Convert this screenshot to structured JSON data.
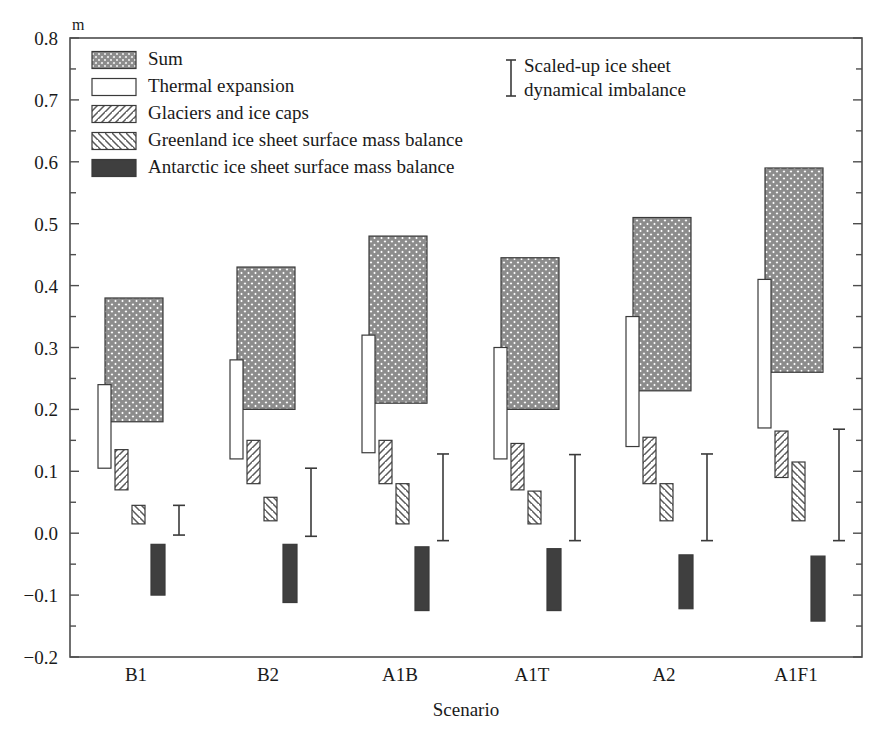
{
  "figure": {
    "y_axis_unit": "m",
    "x_axis_title": "Scenario",
    "y_ticks": [
      "0.8",
      "0.7",
      "0.6",
      "0.5",
      "0.4",
      "0.3",
      "0.2",
      "0.1",
      "0.0",
      "-0.1",
      "-0.2"
    ],
    "frame_color": "#4d4d4d",
    "sum_fill_color": "#9a9a9a",
    "antarctic_fill_color": "#3f3f3f",
    "outline_color": "#3a3a3a"
  },
  "legend": {
    "items": [
      {
        "label": "Sum",
        "pattern": "crosshatch"
      },
      {
        "label": "Thermal expansion",
        "pattern": "empty"
      },
      {
        "label": "Glaciers and ice caps",
        "pattern": "diag-forward"
      },
      {
        "label": "Greenland ice sheet surface mass balance",
        "pattern": "diag-back"
      },
      {
        "label": "Antarctic ice sheet surface mass balance",
        "pattern": "solid"
      }
    ]
  },
  "annotation": {
    "line1": "Scaled-up ice sheet",
    "line2": "dynamical imbalance"
  },
  "chart_data": {
    "type": "bar",
    "title": "",
    "xlabel": "Scenario",
    "ylabel": "m",
    "ylim": [
      -0.2,
      0.8
    ],
    "grid": false,
    "legend_position": "top-left",
    "categories": [
      "B1",
      "B2",
      "A1B",
      "A1T",
      "A2",
      "A1F1"
    ],
    "series": [
      {
        "name": "Sum",
        "pattern": "crosshatch",
        "type": "range-bar",
        "low": [
          0.18,
          0.2,
          0.21,
          0.2,
          0.23,
          0.26
        ],
        "high": [
          0.38,
          0.43,
          0.48,
          0.445,
          0.51,
          0.59
        ]
      },
      {
        "name": "Thermal expansion",
        "pattern": "empty",
        "type": "range-bar",
        "low": [
          0.105,
          0.12,
          0.13,
          0.12,
          0.14,
          0.17
        ],
        "high": [
          0.24,
          0.28,
          0.32,
          0.3,
          0.35,
          0.41
        ]
      },
      {
        "name": "Glaciers and ice caps",
        "pattern": "diag-forward",
        "type": "range-bar",
        "low": [
          0.07,
          0.08,
          0.08,
          0.07,
          0.08,
          0.09
        ],
        "high": [
          0.135,
          0.15,
          0.15,
          0.145,
          0.155,
          0.165
        ]
      },
      {
        "name": "Greenland ice sheet surface mass balance",
        "pattern": "diag-back",
        "type": "range-bar",
        "low": [
          0.015,
          0.02,
          0.015,
          0.015,
          0.02,
          0.02
        ],
        "high": [
          0.045,
          0.058,
          0.08,
          0.068,
          0.08,
          0.115
        ]
      },
      {
        "name": "Antarctic ice sheet surface mass balance",
        "pattern": "solid",
        "type": "range-bar",
        "low": [
          -0.1,
          -0.112,
          -0.125,
          -0.125,
          -0.122,
          -0.142
        ],
        "high": [
          -0.018,
          -0.018,
          -0.022,
          -0.025,
          -0.035,
          -0.037
        ]
      }
    ],
    "error_bars": {
      "name": "Scaled-up ice sheet dynamical imbalance",
      "low": [
        -0.003,
        -0.005,
        -0.012,
        -0.012,
        -0.012,
        -0.012
      ],
      "high": [
        0.045,
        0.105,
        0.128,
        0.127,
        0.128,
        0.168
      ]
    }
  }
}
